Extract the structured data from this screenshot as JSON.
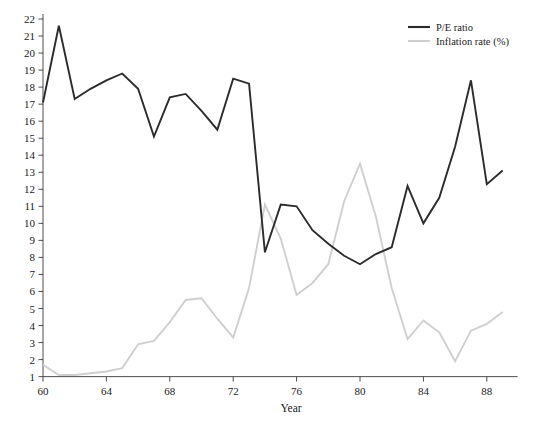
{
  "chart_data": {
    "type": "line",
    "title": "",
    "xlabel": "Year",
    "ylabel": "",
    "grid": false,
    "legend_position": "top-right",
    "xlim": [
      60,
      89
    ],
    "ylim": [
      1,
      22
    ],
    "x_ticks": [
      60,
      64,
      68,
      72,
      76,
      80,
      84,
      88
    ],
    "x_tick_labels": [
      "60",
      "64",
      "68",
      "72",
      "76",
      "80",
      "84",
      "88"
    ],
    "y_ticks": [
      1,
      2,
      3,
      4,
      5,
      6,
      7,
      8,
      9,
      10,
      11,
      12,
      13,
      14,
      15,
      16,
      17,
      18,
      19,
      20,
      21,
      22
    ],
    "y_tick_labels": [
      "1",
      "2",
      "3",
      "4",
      "5",
      "6",
      "7",
      "8",
      "9",
      "10",
      "11",
      "12",
      "13",
      "14",
      "15",
      "16",
      "17",
      "18",
      "19",
      "20",
      "21",
      "22"
    ],
    "x": [
      60,
      61,
      62,
      63,
      64,
      65,
      66,
      67,
      68,
      69,
      70,
      71,
      72,
      73,
      74,
      75,
      76,
      77,
      78,
      79,
      80,
      81,
      82,
      83,
      84,
      85,
      86,
      87,
      88,
      89
    ],
    "series": [
      {
        "name": "P/E ratio",
        "color": "#2b2b2b",
        "width": 1.9,
        "values": [
          17.1,
          21.6,
          17.3,
          17.9,
          18.4,
          18.8,
          17.9,
          15.1,
          17.4,
          17.6,
          16.6,
          15.5,
          18.5,
          18.2,
          8.3,
          11.1,
          11.0,
          9.6,
          8.8,
          8.1,
          7.6,
          8.2,
          8.6,
          12.2,
          10.0,
          11.5,
          14.5,
          18.4,
          12.3,
          13.1
        ]
      },
      {
        "name": "Inflation rate (%)",
        "color": "#cfcfcf",
        "width": 1.9,
        "values": [
          1.7,
          1.1,
          1.1,
          1.2,
          1.3,
          1.5,
          2.9,
          3.1,
          4.2,
          5.5,
          5.6,
          4.4,
          3.3,
          6.2,
          11.1,
          9.1,
          5.8,
          6.5,
          7.6,
          11.3,
          13.5,
          10.4,
          6.2,
          3.2,
          4.3,
          3.6,
          1.9,
          3.7,
          4.1,
          4.8
        ]
      }
    ],
    "legend": [
      {
        "label": "P/E ratio",
        "color": "#2b2b2b"
      },
      {
        "label": "Inflation rate (%)",
        "color": "#cfcfcf"
      }
    ]
  }
}
